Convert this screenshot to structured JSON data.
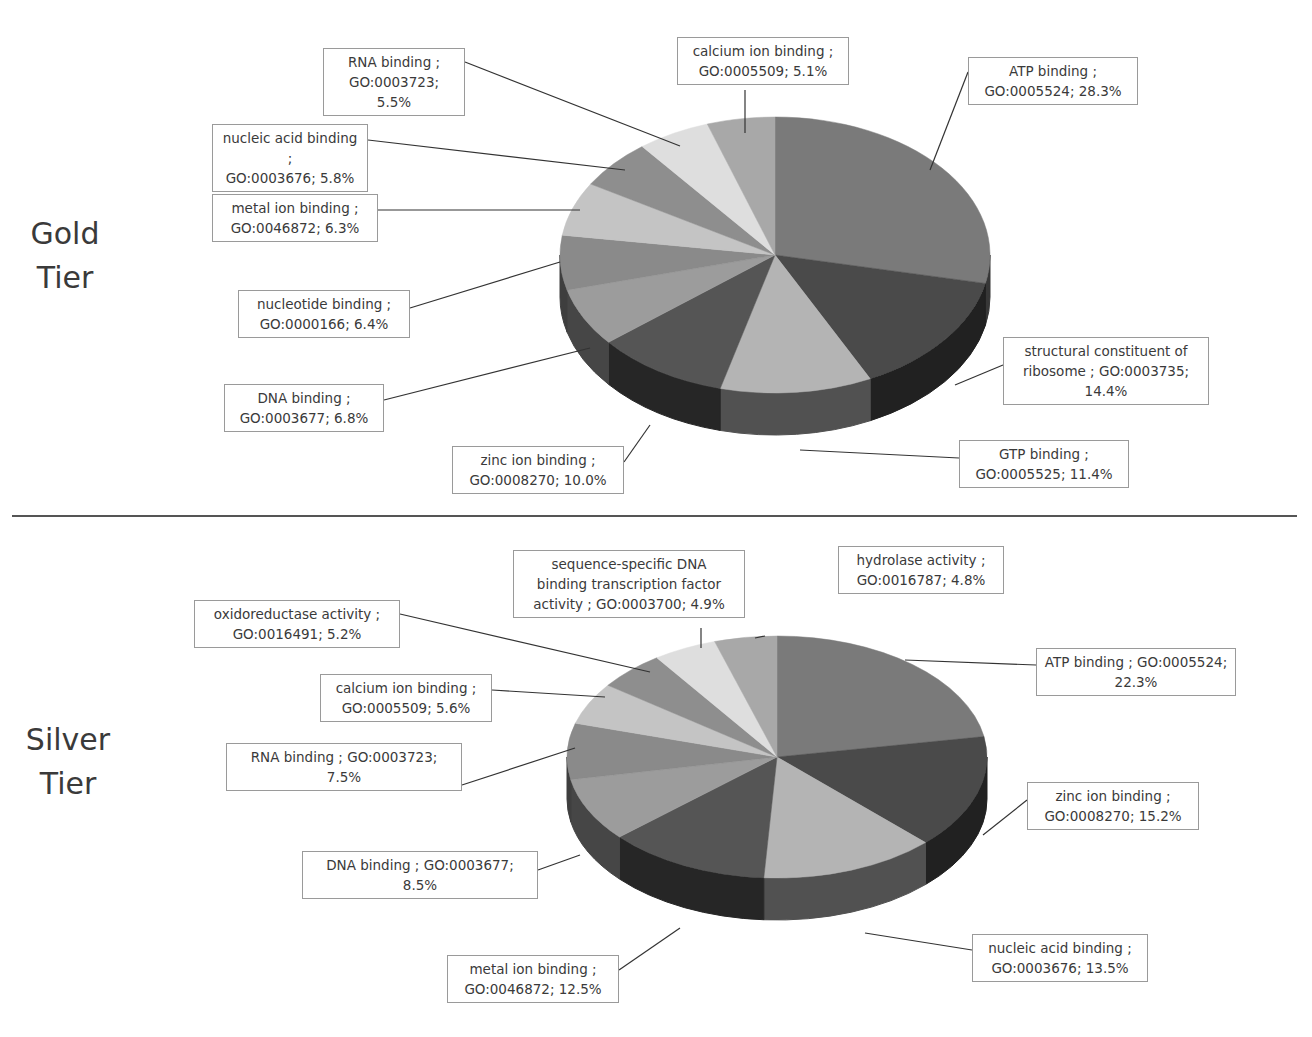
{
  "divider": true,
  "chart_data": [
    {
      "type": "pie",
      "title": "Gold Tier",
      "style": "3d-exploded-none",
      "categories": [
        "ATP binding ; GO:0005524",
        "structural constituent of ribosome ; GO:0003735",
        "GTP binding ; GO:0005525",
        "zinc ion binding ; GO:0008270",
        "DNA binding ; GO:0003677",
        "nucleotide binding ; GO:0000166",
        "metal ion binding ; GO:0046872",
        "nucleic acid binding ; GO:0003676",
        "RNA binding ; GO:0003723",
        "calcium ion binding ; GO:0005509"
      ],
      "values": [
        28.3,
        14.4,
        11.4,
        10.0,
        6.8,
        6.4,
        6.3,
        5.8,
        5.5,
        5.1
      ],
      "colors": [
        "#7a7a7a",
        "#4a4a4a",
        "#b4b4b4",
        "#555555",
        "#9c9c9c",
        "#8a8a8a",
        "#c4c4c4",
        "#8e8e8e",
        "#dedede",
        "#a8a8a8"
      ],
      "legend": "callouts"
    },
    {
      "type": "pie",
      "title": "Silver Tier",
      "style": "3d-exploded-none",
      "categories": [
        "ATP binding ; GO:0005524",
        "zinc ion binding ; GO:0008270",
        "nucleic acid binding ; GO:0003676",
        "metal ion binding ; GO:0046872",
        "DNA binding ; GO:0003677",
        "RNA binding ; GO:0003723",
        "calcium ion binding ; GO:0005509",
        "oxidoreductase activity ; GO:0016491",
        "sequence-specific DNA binding transcription factor activity ; GO:0003700",
        "hydrolase activity ; GO:0016787"
      ],
      "values": [
        22.3,
        15.2,
        13.5,
        12.5,
        8.5,
        7.5,
        5.6,
        5.2,
        4.9,
        4.8
      ],
      "colors": [
        "#7a7a7a",
        "#4a4a4a",
        "#b4b4b4",
        "#555555",
        "#9c9c9c",
        "#8a8a8a",
        "#c4c4c4",
        "#8e8e8e",
        "#dedede",
        "#a8a8a8"
      ],
      "legend": "callouts"
    }
  ],
  "gold": {
    "tier_label": "Gold\nTier",
    "callouts": [
      {
        "text": "ATP binding ;\nGO:0005524; 28.3%"
      },
      {
        "text": "structural constituent of\nribosome ; GO:0003735;\n14.4%"
      },
      {
        "text": "GTP binding ;\nGO:0005525; 11.4%"
      },
      {
        "text": "zinc ion binding ;\nGO:0008270; 10.0%"
      },
      {
        "text": "DNA binding ;\nGO:0003677; 6.8%"
      },
      {
        "text": "nucleotide binding ;\nGO:0000166; 6.4%"
      },
      {
        "text": "metal ion binding ;\nGO:0046872; 6.3%"
      },
      {
        "text": "nucleic acid binding ;\nGO:0003676; 5.8%"
      },
      {
        "text": "RNA binding ;\nGO:0003723; 5.5%"
      },
      {
        "text": "calcium ion binding ;\nGO:0005509; 5.1%"
      }
    ]
  },
  "silver": {
    "tier_label": "Silver\nTier",
    "callouts": [
      {
        "text": "ATP binding ; GO:0005524;\n22.3%"
      },
      {
        "text": "zinc ion binding ;\nGO:0008270; 15.2%"
      },
      {
        "text": "nucleic acid binding ;\nGO:0003676; 13.5%"
      },
      {
        "text": "metal ion binding ;\nGO:0046872; 12.5%"
      },
      {
        "text": "DNA binding ; GO:0003677;\n8.5%"
      },
      {
        "text": "RNA binding ; GO:0003723;\n7.5%"
      },
      {
        "text": "calcium ion binding ;\nGO:0005509; 5.6%"
      },
      {
        "text": "oxidoreductase activity ;\nGO:0016491; 5.2%"
      },
      {
        "text": "sequence-specific DNA\nbinding transcription factor\nactivity ; GO:0003700; 4.9%"
      },
      {
        "text": "hydrolase activity ;\nGO:0016787; 4.8%"
      }
    ]
  }
}
